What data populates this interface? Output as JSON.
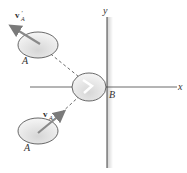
{
  "diagram": {
    "axes": {
      "x_label": "x",
      "y_label": "y"
    },
    "wall": {
      "label": "B"
    },
    "balls": [
      {
        "name": "A",
        "label": "A",
        "velocity_label": "v",
        "velocity_sub": "A",
        "velocity_prime": "′",
        "state": "after"
      },
      {
        "name": "A",
        "label": "A",
        "velocity_label": "v",
        "velocity_sub": "A",
        "velocity_prime": "",
        "state": "before"
      },
      {
        "name": "B-impact",
        "label": ""
      }
    ],
    "colors": {
      "line": "#444444",
      "ball_fill": "#e4e4e4",
      "arrow": "#888888",
      "wall_shade": "#d8d8d8"
    }
  }
}
